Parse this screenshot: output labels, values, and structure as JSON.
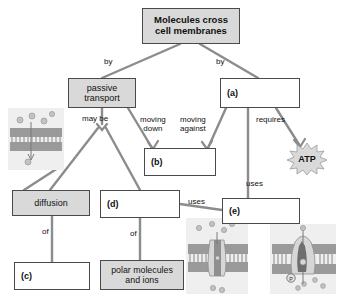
{
  "diagram": {
    "nodes": {
      "top": "Molecules cross\ncell membranes",
      "passive": "passive\ntransport",
      "a": "(a)",
      "b": "(b)",
      "diffusion": "diffusion",
      "d": "(d)",
      "e": "(e)",
      "c": "(c)",
      "polar": "polar molecules\nand ions",
      "atp": "ATP"
    },
    "connector_labels": {
      "by_left": "by",
      "by_right": "by",
      "may_be": "may be",
      "moving_down": "moving\ndown",
      "moving_against": "moving\nagainst",
      "requires": "requires",
      "of_left": "of",
      "of_right": "of",
      "uses_left": "uses",
      "uses_right": "uses"
    },
    "illustrations": {
      "left_membrane": "lipid-bilayer-diffusion-illustration",
      "middle_membrane": "channel-protein-illustration",
      "right_membrane": "pump-protein-phosphate-illustration",
      "phosphate_label": "P"
    },
    "colors": {
      "box_fill_gray": "#d9d9d9",
      "box_fill_white": "#ffffff",
      "box_border": "#4a4a4a",
      "line": "#8c8c8c",
      "text": "#111111",
      "atp_fill": "#d9d9d9",
      "membrane_gray": "#b3b3b3"
    }
  }
}
